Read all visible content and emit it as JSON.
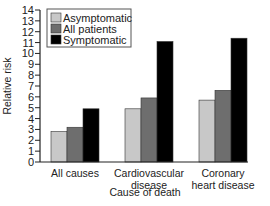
{
  "chart_data": {
    "type": "bar",
    "title": "",
    "xlabel": "Cause of death",
    "ylabel": "Relative risk",
    "ylim": [
      0,
      14
    ],
    "yticks": [
      0,
      1,
      2,
      3,
      4,
      5,
      6,
      7,
      8,
      9,
      10,
      11,
      12,
      13,
      14
    ],
    "grid": false,
    "legend_position": "top-left",
    "categories": [
      [
        "All causes"
      ],
      [
        "Cardiovascular",
        "disease"
      ],
      [
        "Coronary",
        "heart disease"
      ]
    ],
    "category_names": [
      "All causes",
      "Cardiovascular disease",
      "Coronary heart disease"
    ],
    "series": [
      {
        "name": "Asymptomatic",
        "color": "#c8c8c8",
        "values": [
          2.8,
          4.9,
          5.7
        ]
      },
      {
        "name": "All patients",
        "color": "#6e6e6e",
        "values": [
          3.2,
          5.9,
          6.6
        ]
      },
      {
        "name": "Symptomatic",
        "color": "#000000",
        "values": [
          4.9,
          11.1,
          11.4
        ]
      }
    ]
  }
}
